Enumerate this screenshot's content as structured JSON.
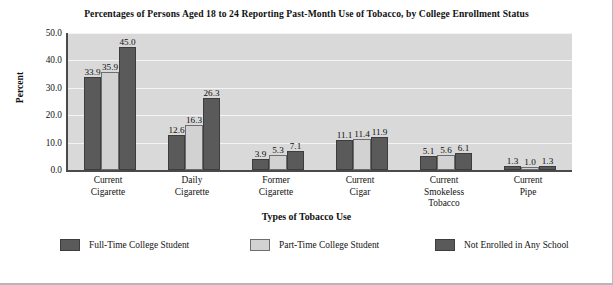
{
  "chart_data": {
    "type": "bar",
    "title": "Percentages of Persons Aged 18 to 24 Reporting Past-Month Use of Tobacco, by College Enrollment Status",
    "xlabel": "Types of Tobacco Use",
    "ylabel": "Percent",
    "ylim": [
      0.0,
      50.0
    ],
    "ytick_labels": [
      "50.0",
      "40.0",
      "30.0",
      "20.0",
      "10.0",
      "0.0"
    ],
    "ytick_values": [
      50.0,
      40.0,
      30.0,
      20.0,
      10.0,
      0.0
    ],
    "grid": true,
    "legend_position": "bottom",
    "categories": [
      "Current Cigarette",
      "Daily Cigarette",
      "Former Cigarette",
      "Current Cigar",
      "Current Smokeless Tobacco",
      "Current Pipe"
    ],
    "category_lines": [
      [
        "Current",
        "Cigarette"
      ],
      [
        "Daily",
        "Cigarette"
      ],
      [
        "Former",
        "Cigarette"
      ],
      [
        "Current",
        "Cigar"
      ],
      [
        "Current",
        "Smokeless",
        "Tobacco"
      ],
      [
        "Current",
        "Pipe"
      ]
    ],
    "series": [
      {
        "name": "Full-Time College Student",
        "color": "#5a5a5a",
        "values": [
          33.9,
          12.6,
          3.9,
          11.1,
          5.1,
          1.3
        ],
        "labels": [
          "33.9",
          "12.6",
          "3.9",
          "11.1",
          "5.1",
          "1.3"
        ]
      },
      {
        "name": "Part-Time College Student",
        "color": "#d2d2d2",
        "values": [
          35.9,
          16.3,
          5.3,
          11.4,
          5.6,
          1.0
        ],
        "labels": [
          "35.9",
          "16.3",
          "5.3",
          "11.4",
          "5.6",
          "1.0"
        ]
      },
      {
        "name": "Not Enrolled in Any School",
        "color": "#5a5a5a",
        "values": [
          45.0,
          26.3,
          7.1,
          11.9,
          6.1,
          1.3
        ],
        "labels": [
          "45.0",
          "26.3",
          "7.1",
          "11.9",
          "6.1",
          "1.3"
        ]
      }
    ]
  }
}
